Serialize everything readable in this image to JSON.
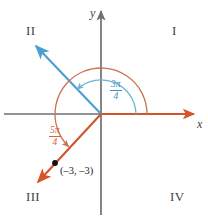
{
  "figure": {
    "colors": {
      "axis": "#6f6f74",
      "blue_ray": "#4a9fd0",
      "blue_arc": "#6fb4d8",
      "orange_ray": "#d4542a",
      "orange_arc": "#c8724f",
      "point": "#111111",
      "text": "#3f3f42"
    }
  },
  "axes": {
    "x_label": "x",
    "y_label": "y",
    "origin": {
      "x": 101,
      "y": 114
    }
  },
  "quadrants": [
    {
      "key": "I",
      "label": "I",
      "x": 172,
      "y": 24
    },
    {
      "key": "II",
      "label": "II",
      "x": 26,
      "y": 24
    },
    {
      "key": "III",
      "label": "III",
      "x": 26,
      "y": 190
    },
    {
      "key": "IV",
      "label": "IV",
      "x": 170,
      "y": 190
    }
  ],
  "angles": [
    {
      "name": "three-pi-over-four",
      "numerator": "3π",
      "denominator": "4",
      "degrees": 135,
      "radians_text": "3π/4",
      "color": "#3a8fc0",
      "arc_radius": 35,
      "label_x": 110,
      "label_y": 80
    },
    {
      "name": "five-pi-over-four",
      "numerator": "5π",
      "denominator": "4",
      "degrees": 225,
      "radians_text": "5π/4",
      "color": "#d8603a",
      "arc_radius": 46,
      "label_x": 49,
      "label_y": 126
    }
  ],
  "point": {
    "label": "(–3, –3)",
    "coords": [
      -3,
      -3
    ],
    "x": 55,
    "y": 163,
    "label_x": 60,
    "label_y": 166
  }
}
